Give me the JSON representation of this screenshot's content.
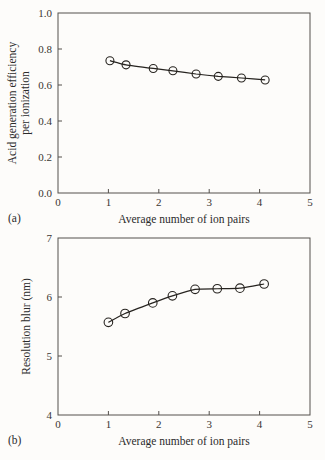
{
  "figure": {
    "background": "#fdfcfa",
    "ink_color": "#26231f",
    "axis_color": "#55514d"
  },
  "panels": [
    {
      "key": "a",
      "label": "(a)",
      "chart_data": {
        "type": "line",
        "title": "",
        "xlabel": "Average number of ion pairs",
        "ylabel": "Acid generation efficiency per ionization",
        "ylabel_lines": [
          "Acid generation efficiency",
          "per ionization"
        ],
        "xlim": [
          0,
          5
        ],
        "ylim": [
          0.0,
          1.0
        ],
        "xticks": [
          0,
          1,
          2,
          3,
          4,
          5
        ],
        "xtick_labels": [
          "0",
          "1",
          "2",
          "3",
          "4",
          "5"
        ],
        "yticks": [
          0.0,
          0.2,
          0.4,
          0.6,
          0.8,
          1.0
        ],
        "ytick_labels": [
          "0.0",
          "0.2",
          "0.4",
          "0.6",
          "0.8",
          "1.0"
        ],
        "grid": false,
        "legend": "none",
        "marker": "open-circle",
        "x": [
          1.03,
          1.35,
          1.89,
          2.28,
          2.74,
          3.18,
          3.64,
          4.11
        ],
        "y": [
          0.735,
          0.712,
          0.692,
          0.679,
          0.661,
          0.648,
          0.639,
          0.628
        ],
        "series": [
          {
            "name": "Acid generation efficiency per ionization",
            "values": [
              0.735,
              0.712,
              0.692,
              0.679,
              0.661,
              0.648,
              0.639,
              0.628
            ]
          }
        ]
      }
    },
    {
      "key": "b",
      "label": "(b)",
      "chart_data": {
        "type": "line",
        "title": "",
        "xlabel": "Average number of ion pairs",
        "ylabel": "Resolution blur (nm)",
        "ylabel_lines": [
          "Resolution blur (nm)"
        ],
        "xlim": [
          0,
          5
        ],
        "ylim": [
          4,
          7
        ],
        "xticks": [
          0,
          1,
          2,
          3,
          4,
          5
        ],
        "xtick_labels": [
          "0",
          "1",
          "2",
          "3",
          "4",
          "5"
        ],
        "yticks": [
          4,
          5,
          6,
          7
        ],
        "ytick_labels": [
          "4",
          "5",
          "6",
          "7"
        ],
        "grid": false,
        "legend": "none",
        "marker": "open-circle",
        "x": [
          1.0,
          1.33,
          1.88,
          2.27,
          2.72,
          3.16,
          3.61,
          4.09
        ],
        "y": [
          5.57,
          5.72,
          5.9,
          6.02,
          6.13,
          6.14,
          6.15,
          6.22
        ],
        "series": [
          {
            "name": "Resolution blur (nm)",
            "values": [
              5.57,
              5.72,
              5.9,
              6.02,
              6.13,
              6.14,
              6.15,
              6.22
            ]
          }
        ]
      }
    }
  ]
}
